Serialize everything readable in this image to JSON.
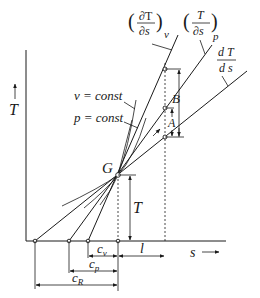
{
  "diagram": {
    "axes": {
      "y_label": "T",
      "x_label": "s"
    },
    "curve_labels": {
      "isochore": "v = const",
      "isobar": "p = const"
    },
    "tangent_labels": {
      "v_num": "∂T",
      "v_den": "∂s",
      "v_sub": "v",
      "p_num": "T",
      "p_den": "∂s",
      "p_sub": "p",
      "d_num": "d T",
      "d_den": "d s"
    },
    "points": {
      "state": "G",
      "A": "A",
      "B": "B"
    },
    "dimensions": {
      "height": "T",
      "subtangent_v": "c",
      "subtangent_v_sub": "v",
      "subtangent_p": "c",
      "subtangent_p_sub": "p",
      "subtangent_R": "c",
      "subtangent_R_sub": "R",
      "length": "l"
    },
    "colors": {
      "line": "#1a1a1a",
      "background": "#ffffff"
    }
  }
}
